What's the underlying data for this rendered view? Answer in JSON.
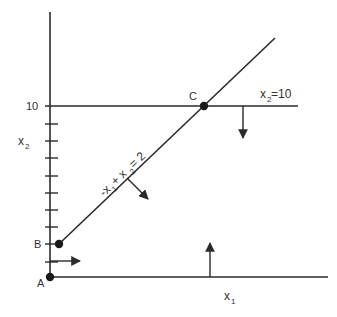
{
  "diagram": {
    "colors": {
      "line": "#2a2a2a",
      "text": "#333333",
      "background": "#ffffff"
    },
    "axes": {
      "x_label": "x",
      "x_sub": "1",
      "y_label": "x",
      "y_sub": "2",
      "y_tick_label": "10"
    },
    "constraints": [
      {
        "id": "c1",
        "label_parts": [
          "-x",
          "1",
          " + x",
          "2",
          " = 2"
        ]
      },
      {
        "id": "c2",
        "label_parts": [
          "x",
          "2",
          " =10"
        ]
      }
    ],
    "points": [
      {
        "id": "A",
        "label": "A"
      },
      {
        "id": "B",
        "label": "B"
      },
      {
        "id": "C",
        "label": "C"
      }
    ],
    "y_ticks_count": 9
  }
}
